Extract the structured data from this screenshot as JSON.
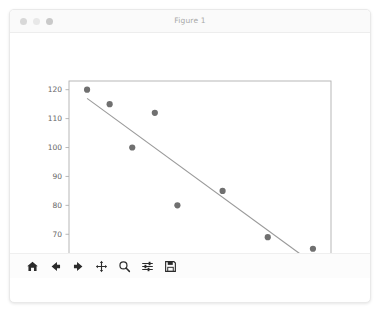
{
  "window": {
    "title": "Figure 1",
    "controls": [
      {
        "name": "close",
        "color": "#d8d8d8"
      },
      {
        "name": "minimize",
        "color": "#e8e8e8"
      },
      {
        "name": "maximize",
        "color": "#c9c9c9"
      }
    ]
  },
  "toolbar": {
    "items": [
      {
        "icon": "home-icon",
        "label": "Home"
      },
      {
        "icon": "back-arrow-icon",
        "label": "Back"
      },
      {
        "icon": "forward-arrow-icon",
        "label": "Forward"
      },
      {
        "icon": "pan-icon",
        "label": "Pan"
      },
      {
        "icon": "zoom-icon",
        "label": "Zoom"
      },
      {
        "icon": "subplot-config-icon",
        "label": "Configure subplots"
      },
      {
        "icon": "save-icon",
        "label": "Save"
      }
    ]
  },
  "chart_data": {
    "type": "scatter",
    "title": "",
    "xlabel": "",
    "ylabel": "",
    "xlim": [
      4.6,
      10.4
    ],
    "ylim": [
      58,
      123
    ],
    "xticks": [
      5,
      6,
      7,
      8,
      9,
      10
    ],
    "yticks": [
      60,
      70,
      80,
      90,
      100,
      110,
      120
    ],
    "xticklabels": [
      "5",
      "6",
      "7",
      "8",
      "9",
      "10"
    ],
    "yticklabels": [
      "60",
      "70",
      "80",
      "90",
      "100",
      "110",
      "120"
    ],
    "grid": false,
    "legend": null,
    "marker_color": "#707070",
    "line_color": "#9a9a9a",
    "axes_color": "#b0b0b0",
    "series": [
      {
        "name": "observations",
        "type": "scatter",
        "x": [
          5,
          5.5,
          6,
          6.5,
          7,
          8,
          9,
          10
        ],
        "y": [
          120,
          115,
          100,
          112,
          80,
          85,
          69,
          65
        ]
      },
      {
        "name": "fit-line",
        "type": "line",
        "x": [
          5,
          10
        ],
        "y": [
          117,
          60
        ]
      }
    ]
  }
}
